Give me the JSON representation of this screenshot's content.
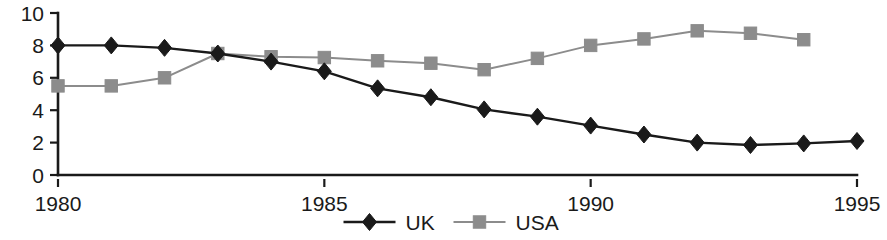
{
  "chart_data": {
    "type": "line",
    "title": "",
    "subtitle": "",
    "xlabel": "",
    "ylabel": "",
    "x": [
      1980,
      1981,
      1982,
      1983,
      1984,
      1985,
      1986,
      1987,
      1988,
      1989,
      1990,
      1991,
      1992,
      1993,
      1994,
      1995
    ],
    "xlim": [
      1980,
      1995
    ],
    "ylim": [
      0,
      10
    ],
    "x_tick_labels": [
      "1980",
      "1985",
      "1990",
      "1995"
    ],
    "x_ticks": [
      1980,
      1985,
      1990,
      1995
    ],
    "y_tick_labels": [
      "0",
      "2",
      "4",
      "6",
      "8",
      "10"
    ],
    "y_ticks": [
      0,
      2,
      4,
      6,
      8,
      10
    ],
    "grid": false,
    "legend_position": "bottom-center",
    "series": [
      {
        "name": "UK",
        "marker": "diamond",
        "color": "#1a1a1a",
        "x": [
          1980,
          1981,
          1982,
          1983,
          1984,
          1985,
          1986,
          1987,
          1988,
          1989,
          1990,
          1991,
          1992,
          1993,
          1994,
          1995
        ],
        "values": [
          8.0,
          8.0,
          7.85,
          7.5,
          7.0,
          6.4,
          5.35,
          4.8,
          4.05,
          3.6,
          3.05,
          2.5,
          2.0,
          1.85,
          1.95,
          2.1
        ]
      },
      {
        "name": "USA",
        "marker": "square",
        "color": "#8c8c8c",
        "x": [
          1980,
          1981,
          1982,
          1983,
          1984,
          1985,
          1986,
          1987,
          1988,
          1989,
          1990,
          1991,
          1992,
          1993,
          1994
        ],
        "values": [
          5.5,
          5.5,
          6.0,
          7.5,
          7.3,
          7.25,
          7.05,
          6.9,
          6.5,
          7.2,
          8.0,
          8.4,
          8.9,
          8.75,
          8.35
        ]
      }
    ],
    "legend": [
      {
        "label": "UK",
        "marker": "diamond",
        "color": "#1a1a1a"
      },
      {
        "label": "USA",
        "marker": "square",
        "color": "#8c8c8c"
      }
    ],
    "colors": {
      "axis": "#1a1a1a",
      "uk": "#1a1a1a",
      "usa": "#8c8c8c",
      "background": "#ffffff"
    }
  }
}
